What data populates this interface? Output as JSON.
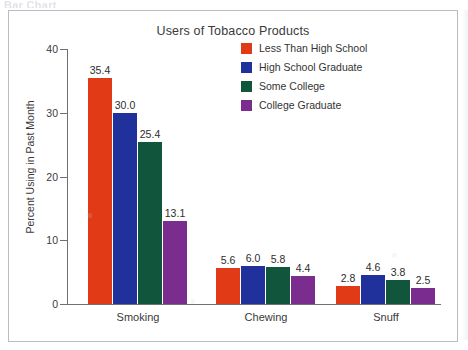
{
  "page_header_ghost": "Bar Chart",
  "chart_data": {
    "type": "bar",
    "title": "Users of Tobacco Products",
    "xlabel": "",
    "ylabel": "Percent Using in Past Month",
    "categories": [
      "Smoking",
      "Chewing",
      "Snuff"
    ],
    "ylim": [
      0,
      40
    ],
    "yticks": [
      0,
      10,
      20,
      30,
      40
    ],
    "ytick_labels": [
      "0",
      "10",
      "20",
      "30",
      "40"
    ],
    "grid": false,
    "legend_position": "top-right",
    "show_value_labels": true,
    "series": [
      {
        "name": "Less Than High School",
        "color": "#E03A16",
        "values": [
          35.4,
          5.6,
          2.8
        ],
        "labels": [
          "35.4",
          "5.6",
          "2.8"
        ]
      },
      {
        "name": "High School Graduate",
        "color": "#20319B",
        "values": [
          30.0,
          6.0,
          4.6
        ],
        "labels": [
          "30.0",
          "6.0",
          "4.6"
        ]
      },
      {
        "name": "Some College",
        "color": "#11563C",
        "values": [
          25.4,
          5.8,
          3.8
        ],
        "labels": [
          "25.4",
          "5.8",
          "3.8"
        ]
      },
      {
        "name": "College Graduate",
        "color": "#7A2D8E",
        "values": [
          13.1,
          4.4,
          2.5
        ],
        "labels": [
          "13.1",
          "4.4",
          "2.5"
        ]
      }
    ]
  }
}
